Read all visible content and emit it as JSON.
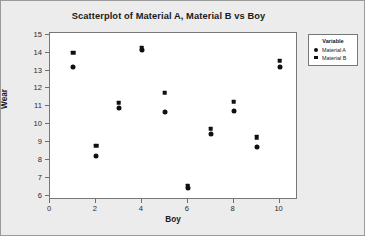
{
  "chart_data": {
    "type": "scatter",
    "title": "Scatterplot of Material A, Material B vs Boy",
    "xlabel": "Boy",
    "ylabel": "Wear",
    "xlim": [
      0,
      10.8
    ],
    "ylim": [
      5.75,
      15.1
    ],
    "xticks": [
      0,
      2,
      4,
      6,
      8,
      10
    ],
    "yticks": [
      6,
      7,
      8,
      9,
      10,
      11,
      12,
      13,
      14,
      15
    ],
    "xticklabels": [
      "0",
      "2",
      "4",
      "6",
      "8",
      "10"
    ],
    "yticklabels": [
      "6",
      "7",
      "8",
      "9",
      "10",
      "11",
      "12",
      "13",
      "14",
      "15"
    ],
    "grid": false,
    "legend_position": "right-outside",
    "x": [
      1,
      2,
      3,
      4,
      5,
      6,
      7,
      8,
      9,
      10
    ],
    "series": [
      {
        "name": "Material A",
        "marker": "circle",
        "color": "#101010",
        "values": [
          13.2,
          8.2,
          10.9,
          14.15,
          10.7,
          6.4,
          9.45,
          10.75,
          8.7,
          13.2
        ]
      },
      {
        "name": "Material B",
        "marker": "square",
        "color": "#101010",
        "values": [
          14.0,
          8.8,
          11.2,
          14.25,
          11.75,
          6.55,
          9.75,
          11.25,
          9.25,
          13.55
        ]
      }
    ]
  },
  "legend": {
    "title": "Variable",
    "entries": [
      {
        "label": "Material A",
        "marker": "circle"
      },
      {
        "label": "Material B",
        "marker": "square"
      }
    ]
  },
  "colors": {
    "figure_background": "#ececec",
    "plot_background": "#ffffff",
    "marker": "#101010",
    "axis": "#777777",
    "text": "#1a1a1a"
  }
}
